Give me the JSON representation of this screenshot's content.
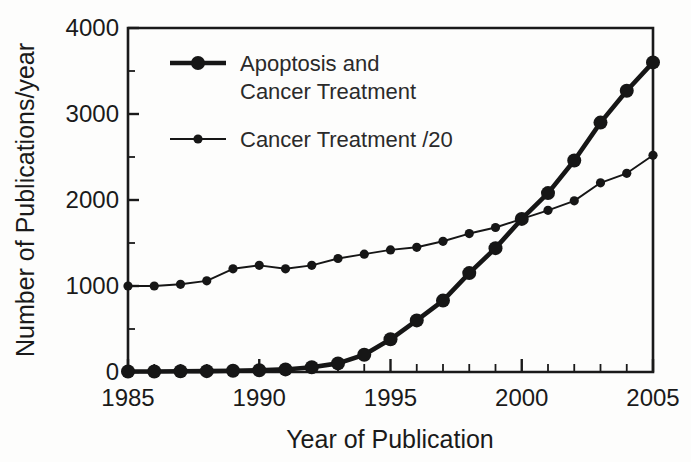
{
  "chart_data": {
    "type": "line",
    "title": "",
    "xlabel": "Year of Publication",
    "ylabel": "Number of Publications/year",
    "xlim": [
      1985,
      2005
    ],
    "ylim": [
      0,
      4000
    ],
    "grid": false,
    "legend_position": "top-left-inside",
    "x_ticks_major": [
      1985,
      1990,
      1995,
      2000,
      2005
    ],
    "x_tick_labels": [
      "1985",
      "1990",
      "1995",
      "2000",
      "2005"
    ],
    "x_tick_minor_step": 1,
    "y_ticks_major": [
      0,
      1000,
      2000,
      3000,
      4000
    ],
    "y_tick_labels": [
      "0",
      "1000",
      "2000",
      "3000",
      "4000"
    ],
    "y_tick_minor_step": 500,
    "x": [
      1985,
      1986,
      1987,
      1988,
      1989,
      1990,
      1991,
      1992,
      1993,
      1994,
      1995,
      1996,
      1997,
      1998,
      1999,
      2000,
      2001,
      2002,
      2003,
      2004,
      2005
    ],
    "series": [
      {
        "name": "Apoptosis and Cancer Treatment",
        "style": "thick",
        "marker_size": 7.0,
        "color": "#161616",
        "values": [
          5,
          6,
          8,
          10,
          14,
          20,
          30,
          55,
          100,
          200,
          380,
          600,
          830,
          1150,
          1440,
          1780,
          2080,
          2460,
          2900,
          3270,
          3600
        ]
      },
      {
        "name": "Cancer Treatment /20",
        "style": "thin",
        "marker_size": 4.6,
        "color": "#161616",
        "values": [
          1000,
          1000,
          1020,
          1060,
          1200,
          1240,
          1200,
          1240,
          1320,
          1370,
          1420,
          1450,
          1520,
          1610,
          1680,
          1780,
          1880,
          1990,
          2200,
          2310,
          2520
        ]
      }
    ],
    "legend_entries": [
      {
        "label_line1": "Apoptosis and",
        "label_line2": "Cancer Treatment",
        "style": "thick"
      },
      {
        "label_line1": "Cancer Treatment /20",
        "label_line2": "",
        "style": "thin"
      }
    ]
  },
  "colors": {
    "ink": "#161616",
    "axis": "#1a1a1a",
    "background": "#fdfdfc"
  }
}
